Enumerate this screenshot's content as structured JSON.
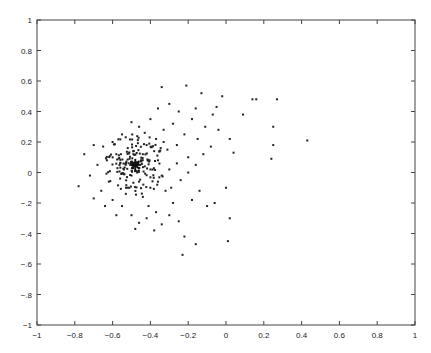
{
  "chart_data": {
    "type": "scatter",
    "title": "",
    "xlabel": "",
    "ylabel": "",
    "xlim": [
      -1,
      1
    ],
    "ylim": [
      -1,
      1
    ],
    "grid": false,
    "legend": null,
    "x_ticks": [
      "-1",
      "-0.8",
      "-0.6",
      "-0.4",
      "-0.2",
      "0",
      "0.2",
      "0.4",
      "0.6",
      "0.8",
      "1"
    ],
    "y_ticks": [
      "1",
      "0.8",
      "0.6",
      "0.4",
      "0.2",
      "0",
      "-.2",
      "-.4",
      "-.6",
      "-.8",
      "-1"
    ],
    "marker_color": "#222222",
    "center_marker": {
      "shape": "star",
      "x": -0.48,
      "y": 0.05
    },
    "series": [
      {
        "name": "points",
        "points": [
          [
            -0.34,
            0.56
          ],
          [
            -0.21,
            0.57
          ],
          [
            -0.13,
            0.52
          ],
          [
            -0.02,
            0.5
          ],
          [
            0.14,
            0.48
          ],
          [
            0.16,
            0.48
          ],
          [
            0.27,
            0.48
          ],
          [
            0.09,
            0.38
          ],
          [
            0.25,
            0.3
          ],
          [
            0.43,
            0.21
          ],
          [
            0.25,
            0.18
          ],
          [
            0.24,
            0.09
          ],
          [
            -0.05,
            0.43
          ],
          [
            -0.07,
            0.38
          ],
          [
            -0.16,
            0.42
          ],
          [
            -0.11,
            0.3
          ],
          [
            -0.04,
            0.28
          ],
          [
            0.02,
            0.22
          ],
          [
            0.04,
            0.13
          ],
          [
            -0.08,
            0.17
          ],
          [
            -0.18,
            0.35
          ],
          [
            -0.25,
            0.4
          ],
          [
            -0.3,
            0.45
          ],
          [
            -0.36,
            0.42
          ],
          [
            -0.4,
            0.35
          ],
          [
            -0.28,
            0.32
          ],
          [
            -0.33,
            0.28
          ],
          [
            -0.22,
            0.25
          ],
          [
            -0.15,
            0.22
          ],
          [
            -0.12,
            0.12
          ],
          [
            -0.2,
            0.1
          ],
          [
            -0.26,
            0.18
          ],
          [
            -0.31,
            0.15
          ],
          [
            -0.37,
            0.22
          ],
          [
            -0.43,
            0.26
          ],
          [
            -0.46,
            0.3
          ],
          [
            -0.5,
            0.33
          ],
          [
            -0.55,
            0.25
          ],
          [
            -0.6,
            0.2
          ],
          [
            -0.65,
            0.17
          ],
          [
            -0.7,
            0.18
          ],
          [
            -0.75,
            0.12
          ],
          [
            -0.78,
            -0.09
          ],
          [
            -0.72,
            -0.02
          ],
          [
            -0.68,
            0.05
          ],
          [
            -0.63,
            0.08
          ],
          [
            -0.58,
            0.12
          ],
          [
            -0.62,
            -0.06
          ],
          [
            -0.66,
            -0.12
          ],
          [
            -0.7,
            -0.17
          ],
          [
            -0.6,
            -0.18
          ],
          [
            -0.55,
            -0.22
          ],
          [
            -0.5,
            -0.28
          ],
          [
            -0.46,
            -0.33
          ],
          [
            -0.48,
            -0.37
          ],
          [
            -0.42,
            -0.3
          ],
          [
            -0.38,
            -0.38
          ],
          [
            -0.34,
            -0.34
          ],
          [
            -0.3,
            -0.28
          ],
          [
            -0.25,
            -0.32
          ],
          [
            -0.22,
            -0.42
          ],
          [
            -0.23,
            -0.54
          ],
          [
            -0.16,
            -0.47
          ],
          [
            0.01,
            -0.45
          ],
          [
            0.02,
            -0.3
          ],
          [
            -0.1,
            -0.22
          ],
          [
            -0.18,
            -0.18
          ],
          [
            -0.14,
            -0.12
          ],
          [
            -0.06,
            -0.2
          ],
          [
            0.0,
            -0.1
          ],
          [
            -0.28,
            -0.2
          ],
          [
            -0.32,
            -0.12
          ],
          [
            -0.36,
            -0.06
          ],
          [
            -0.4,
            -0.1
          ],
          [
            -0.44,
            -0.16
          ],
          [
            -0.52,
            -0.1
          ],
          [
            -0.56,
            -0.04
          ],
          [
            -0.4,
            0.02
          ],
          [
            -0.36,
            0.08
          ],
          [
            -0.3,
            0.02
          ],
          [
            -0.24,
            -0.05
          ],
          [
            -0.2,
            0.0
          ],
          [
            -0.16,
            0.05
          ],
          [
            -0.26,
            0.06
          ],
          [
            -0.44,
            0.12
          ],
          [
            -0.52,
            0.16
          ],
          [
            -0.56,
            0.06
          ],
          [
            -0.42,
            0.18
          ],
          [
            -0.38,
            0.14
          ],
          [
            -0.34,
            -0.02
          ],
          [
            -0.5,
            -0.02
          ],
          [
            -0.46,
            -0.06
          ],
          [
            -0.54,
            0.02
          ],
          [
            -0.45,
            0.08
          ],
          [
            -0.51,
            0.09
          ],
          [
            -0.47,
            0.0
          ],
          [
            -0.49,
            0.12
          ],
          [
            -0.43,
            0.04
          ],
          [
            -0.53,
            -0.14
          ],
          [
            -0.41,
            -0.22
          ],
          [
            -0.37,
            -0.26
          ],
          [
            -0.29,
            -0.1
          ],
          [
            -0.33,
            0.2
          ],
          [
            -0.58,
            -0.28
          ],
          [
            -0.64,
            -0.22
          ]
        ]
      }
    ]
  }
}
